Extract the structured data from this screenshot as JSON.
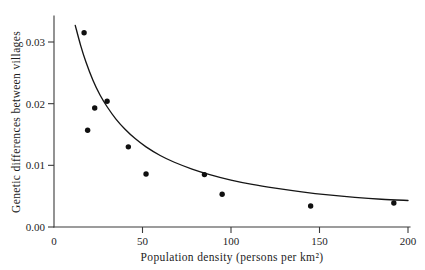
{
  "chart_data": {
    "type": "scatter",
    "title": "",
    "subtitle": "",
    "xlabel": "Population density (persons per km²)",
    "ylabel": "Genetic differences between villages",
    "xlim": [
      0,
      200
    ],
    "ylim": [
      0,
      0.034
    ],
    "grid": false,
    "legend": null,
    "xticks": [
      0,
      50,
      100,
      150,
      200
    ],
    "xtick_labels": [
      "0",
      "50",
      "100",
      "150",
      "200"
    ],
    "yticks": [
      0.0,
      0.01,
      0.02,
      0.03
    ],
    "ytick_labels": [
      "0.00",
      "0.01",
      "0.02",
      "0.03"
    ],
    "points": [
      {
        "x": 17,
        "y": 0.0315
      },
      {
        "x": 19,
        "y": 0.0157
      },
      {
        "x": 23,
        "y": 0.0193
      },
      {
        "x": 30,
        "y": 0.0204
      },
      {
        "x": 42,
        "y": 0.013
      },
      {
        "x": 52,
        "y": 0.0086
      },
      {
        "x": 85,
        "y": 0.0085
      },
      {
        "x": 95,
        "y": 0.0053
      },
      {
        "x": 145,
        "y": 0.0034
      },
      {
        "x": 192,
        "y": 0.0039
      }
    ],
    "fit_curve": {
      "name": "fitted decay curve",
      "x": [
        12,
        15,
        18,
        22,
        26,
        30,
        35,
        40,
        46,
        52,
        60,
        68,
        78,
        88,
        100,
        112,
        125,
        140,
        155,
        170,
        185,
        200
      ],
      "y": [
        0.0327,
        0.0295,
        0.0268,
        0.0238,
        0.0214,
        0.0195,
        0.0175,
        0.0159,
        0.0143,
        0.013,
        0.0116,
        0.0105,
        0.0094,
        0.0085,
        0.0076,
        0.0069,
        0.0063,
        0.0057,
        0.0052,
        0.0048,
        0.0045,
        0.0043
      ]
    },
    "point_marker": "filled-circle",
    "point_color": "#101010",
    "curve_color": "#151515",
    "axis_color": "#3a3a3a",
    "background_color": "#ffffff"
  }
}
